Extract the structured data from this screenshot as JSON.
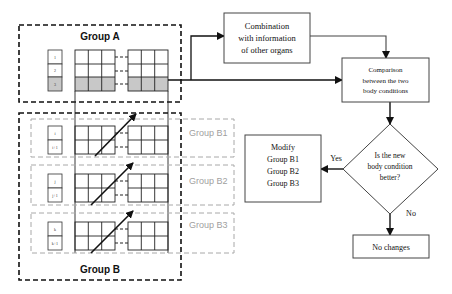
{
  "groups": {
    "a": {
      "label": "Group A",
      "indices": [
        "1",
        "2",
        "3"
      ]
    },
    "b": {
      "label": "Group B"
    },
    "b1": {
      "label": "Group B1",
      "indices": [
        "i",
        "i+1"
      ]
    },
    "b2": {
      "label": "Group B2",
      "indices": [
        "j",
        "j+1"
      ]
    },
    "b3": {
      "label": "Group B3",
      "indices": [
        "k",
        "k+1"
      ]
    }
  },
  "flow": {
    "combination": {
      "lines": [
        "Combination",
        "with information",
        "of other organs"
      ]
    },
    "comparison": {
      "lines": [
        "Comparison",
        "between the two",
        "body conditions"
      ]
    },
    "decision": {
      "lines": [
        "Is the new",
        "body condition",
        "better?"
      ]
    },
    "modify": {
      "lines": [
        "Modify",
        "Group B1",
        "Group B2",
        "Group B3"
      ]
    },
    "no_changes": {
      "label": "No changes"
    },
    "yes_label": "Yes",
    "no_label": "No"
  },
  "colors": {
    "line": "#111111",
    "highlight_row": "#c8c8c8",
    "subgroup_dash": "#a8a8a8",
    "subgroup_text": "#a0a0a0"
  }
}
